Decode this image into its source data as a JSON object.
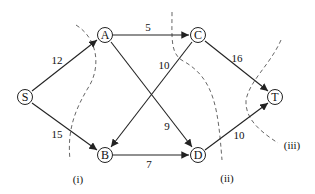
{
  "diagram": {
    "type": "network-flow",
    "nodes": [
      {
        "id": "S",
        "label": "S",
        "x": 25,
        "y": 97
      },
      {
        "id": "A",
        "label": "A",
        "x": 105,
        "y": 35
      },
      {
        "id": "B",
        "label": "B",
        "x": 105,
        "y": 155
      },
      {
        "id": "C",
        "label": "C",
        "x": 198,
        "y": 35
      },
      {
        "id": "D",
        "label": "D",
        "x": 198,
        "y": 155
      },
      {
        "id": "T",
        "label": "T",
        "x": 275,
        "y": 97
      }
    ],
    "edges": [
      {
        "from": "S",
        "to": "A",
        "capacity": "12",
        "lx": 57,
        "ly": 60
      },
      {
        "from": "S",
        "to": "B",
        "capacity": "15",
        "lx": 57,
        "ly": 134
      },
      {
        "from": "A",
        "to": "C",
        "capacity": "5",
        "lx": 148,
        "ly": 27
      },
      {
        "from": "A",
        "to": "D",
        "capacity": "9",
        "lx": 167,
        "ly": 126
      },
      {
        "from": "C",
        "to": "B",
        "capacity": "10",
        "lx": 164,
        "ly": 65
      },
      {
        "from": "C",
        "to": "T",
        "capacity": "16",
        "lx": 237,
        "ly": 58
      },
      {
        "from": "B",
        "to": "D",
        "capacity": "7",
        "lx": 149,
        "ly": 164
      },
      {
        "from": "D",
        "to": "T",
        "capacity": "10",
        "lx": 239,
        "ly": 135
      }
    ],
    "cuts": [
      {
        "label": "(i)",
        "lx": 78,
        "ly": 179
      },
      {
        "label": "(ii)",
        "lx": 227,
        "ly": 178
      },
      {
        "label": "(iii)",
        "lx": 292,
        "ly": 145
      }
    ]
  }
}
